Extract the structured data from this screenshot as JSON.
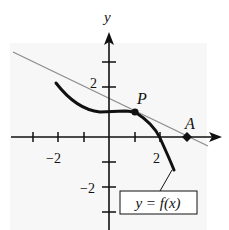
{
  "figure": {
    "type": "function-graph-with-tangent",
    "axis_labels": {
      "y": "y"
    },
    "tick_labels": {
      "x": [
        {
          "value": -2,
          "text": "−2"
        },
        {
          "value": 2,
          "text": "2"
        }
      ],
      "y": [
        {
          "value": 2,
          "text": "2"
        },
        {
          "value": -2,
          "text": "−2"
        }
      ]
    },
    "x_ticks": [
      -3,
      -2,
      -1,
      1,
      2
    ],
    "y_ticks": [
      3,
      2,
      -1,
      -2,
      -3
    ],
    "points": [
      {
        "name": "P",
        "label": "P",
        "x": 1,
        "y": 1
      },
      {
        "name": "A",
        "label": "A",
        "x": 3,
        "y": 0
      }
    ],
    "curve_label": "y = f(x)",
    "colors": {
      "curve": "#111111",
      "tangent": "#8c8c8c",
      "axes": "#111111",
      "panel": "#f6f6f6"
    }
  }
}
